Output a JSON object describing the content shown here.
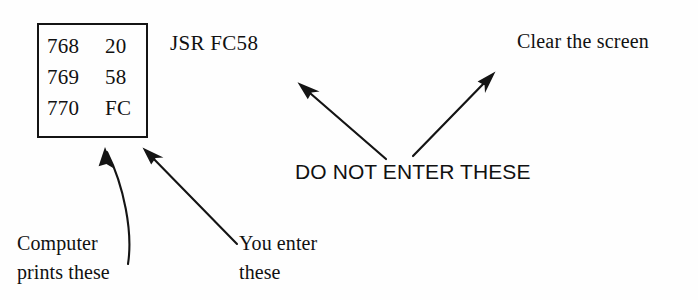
{
  "page": {
    "background_color": "#fefefe",
    "ink_color": "#111111"
  },
  "memory_listing": {
    "name": "memory-listing-box",
    "columns": [
      "address",
      "value"
    ],
    "rows": [
      {
        "address": "768",
        "value": "20"
      },
      {
        "address": "769",
        "value": "58"
      },
      {
        "address": "770",
        "value": "FC"
      }
    ]
  },
  "annotations": {
    "mnemonic": "JSR FC58",
    "clear_screen": "Clear the screen",
    "do_not_enter": "DO NOT ENTER THESE",
    "computer_prints": {
      "line1": "Computer",
      "line2": "prints these"
    },
    "you_enter": {
      "line1": "You enter",
      "line2": "these"
    }
  },
  "arrows": [
    {
      "name": "arrow-computer-prints",
      "style": "curved",
      "from": [
        128,
        262
      ],
      "to": [
        105,
        148
      ],
      "points_to": "memory-listing-box"
    },
    {
      "name": "arrow-you-enter",
      "style": "straight",
      "from": [
        236,
        243
      ],
      "to": [
        143,
        148
      ],
      "points_to": "memory-listing-box"
    },
    {
      "name": "arrow-do-not-enter-left",
      "style": "straight",
      "from": [
        385,
        158
      ],
      "to": [
        298,
        82
      ],
      "points_to": "mnemonic"
    },
    {
      "name": "arrow-do-not-enter-right",
      "style": "straight",
      "from": [
        414,
        155
      ],
      "to": [
        495,
        72
      ],
      "points_to": "clear-screen"
    }
  ]
}
